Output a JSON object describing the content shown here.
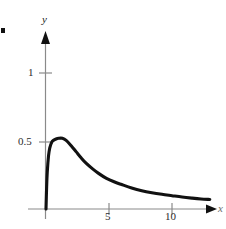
{
  "figure": {
    "name": "gamma-like-density-curve",
    "background": "#ffffff",
    "curve_color": "#111111",
    "axis_color": "#8a8a8a",
    "corner_mark": "bullet-mark"
  },
  "labels": {
    "y_axis": "y",
    "x_axis": "x"
  },
  "chart_data": {
    "type": "line",
    "title": "",
    "xlabel": "x",
    "ylabel": "y",
    "xlim": [
      -0.4,
      13.8
    ],
    "ylim": [
      -0.08,
      1.35
    ],
    "grid": false,
    "legend": null,
    "x_ticks": [
      5,
      10
    ],
    "x_tick_labels": [
      "5",
      "10"
    ],
    "y_ticks": [
      0.5,
      1
    ],
    "y_tick_labels": [
      "0.5",
      "1"
    ],
    "series": [
      {
        "name": "curve",
        "x": [
          0,
          0.05,
          0.1,
          0.2,
          0.3,
          0.45,
          0.6,
          0.8,
          1.0,
          1.3,
          1.6,
          2.0,
          2.4,
          2.8,
          3.2,
          3.7,
          4.2,
          4.8,
          5.4,
          6.0,
          6.8,
          7.6,
          8.4,
          9.2,
          10.0,
          10.8,
          11.6,
          12.3,
          13.0
        ],
        "y": [
          0,
          0.16,
          0.27,
          0.39,
          0.45,
          0.49,
          0.505,
          0.515,
          0.52,
          0.52,
          0.505,
          0.465,
          0.42,
          0.375,
          0.335,
          0.295,
          0.26,
          0.225,
          0.2,
          0.18,
          0.155,
          0.135,
          0.12,
          0.108,
          0.098,
          0.088,
          0.08,
          0.074,
          0.07
        ]
      }
    ],
    "annotations": [
      {
        "name": "peak",
        "x": 1.3,
        "y": 0.52
      },
      {
        "name": "origin-start",
        "x": 0,
        "y": 0
      }
    ]
  }
}
